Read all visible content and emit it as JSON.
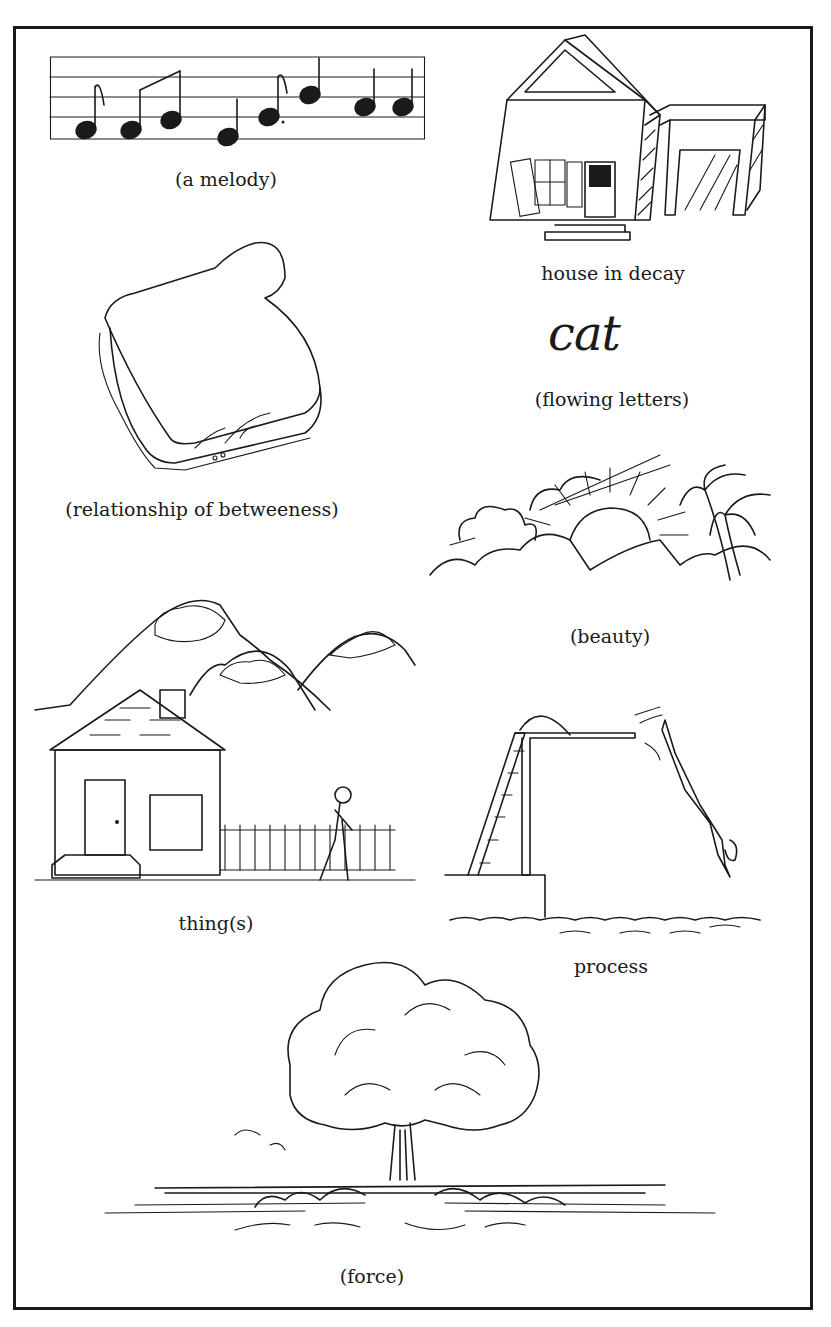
{
  "page": {
    "border_color": "#1a1a1a",
    "background": "#ffffff"
  },
  "illustrations": [
    {
      "id": "melody",
      "caption": "(a melody)",
      "icon": "music-staff-icon"
    },
    {
      "id": "house-in-decay",
      "caption": "house in decay",
      "icon": "decaying-house-icon"
    },
    {
      "id": "sandwich",
      "caption": "(relationship of betweeness)",
      "icon": "sandwich-icon"
    },
    {
      "id": "cat",
      "caption": "(flowing letters)",
      "word": "cat",
      "icon": "cursive-word-icon"
    },
    {
      "id": "sunset",
      "caption": "(beauty)",
      "icon": "sunset-palm-icon"
    },
    {
      "id": "house-scene",
      "caption": "thing(s)",
      "icon": "house-mountains-icon"
    },
    {
      "id": "diver",
      "caption": "process",
      "icon": "diving-board-icon"
    },
    {
      "id": "explosion",
      "caption": "(force)",
      "icon": "mushroom-cloud-icon"
    }
  ]
}
